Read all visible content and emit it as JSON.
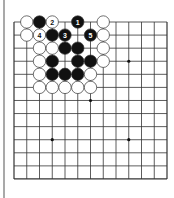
{
  "board": {
    "size_visible": {
      "cols": 13,
      "rows": 13
    },
    "origin": {
      "x": 14,
      "y": 22
    },
    "pitch": {
      "x": 12.75,
      "y": 13.08
    },
    "line_color": "#333333",
    "star_points": [
      [
        3,
        3
      ],
      [
        9,
        3
      ],
      [
        6,
        6
      ],
      [
        3,
        9
      ],
      [
        9,
        9
      ]
    ],
    "stones": [
      {
        "c": 1,
        "r": 0,
        "color": "white",
        "label": ""
      },
      {
        "c": 2,
        "r": 0,
        "color": "black",
        "label": ""
      },
      {
        "c": 3,
        "r": 0,
        "color": "white",
        "label": "2"
      },
      {
        "c": 5,
        "r": 0,
        "color": "black",
        "label": "1"
      },
      {
        "c": 7,
        "r": 0,
        "color": "white",
        "label": ""
      },
      {
        "c": 1,
        "r": 1,
        "color": "white",
        "label": ""
      },
      {
        "c": 2,
        "r": 1,
        "color": "white",
        "label": "4"
      },
      {
        "c": 3,
        "r": 1,
        "color": "black",
        "label": ""
      },
      {
        "c": 4,
        "r": 1,
        "color": "black",
        "label": "3"
      },
      {
        "c": 6,
        "r": 1,
        "color": "black",
        "label": "5"
      },
      {
        "c": 7,
        "r": 1,
        "color": "white",
        "label": ""
      },
      {
        "c": 2,
        "r": 2,
        "color": "white",
        "label": ""
      },
      {
        "c": 3,
        "r": 2,
        "color": "white",
        "label": ""
      },
      {
        "c": 4,
        "r": 2,
        "color": "black",
        "label": ""
      },
      {
        "c": 5,
        "r": 2,
        "color": "black",
        "label": ""
      },
      {
        "c": 7,
        "r": 2,
        "color": "white",
        "label": ""
      },
      {
        "c": 2,
        "r": 3,
        "color": "white",
        "label": ""
      },
      {
        "c": 3,
        "r": 3,
        "color": "black",
        "label": ""
      },
      {
        "c": 5,
        "r": 3,
        "color": "black",
        "label": ""
      },
      {
        "c": 6,
        "r": 3,
        "color": "black",
        "label": ""
      },
      {
        "c": 7,
        "r": 3,
        "color": "white",
        "label": ""
      },
      {
        "c": 2,
        "r": 4,
        "color": "white",
        "label": ""
      },
      {
        "c": 3,
        "r": 4,
        "color": "black",
        "label": ""
      },
      {
        "c": 4,
        "r": 4,
        "color": "black",
        "label": ""
      },
      {
        "c": 5,
        "r": 4,
        "color": "black",
        "label": ""
      },
      {
        "c": 6,
        "r": 4,
        "color": "white",
        "label": ""
      },
      {
        "c": 2,
        "r": 5,
        "color": "white",
        "label": ""
      },
      {
        "c": 3,
        "r": 5,
        "color": "white",
        "label": ""
      },
      {
        "c": 4,
        "r": 5,
        "color": "white",
        "label": ""
      },
      {
        "c": 5,
        "r": 5,
        "color": "white",
        "label": ""
      },
      {
        "c": 6,
        "r": 5,
        "color": "white",
        "label": ""
      }
    ]
  },
  "colors": {
    "black_stone": "#111111",
    "white_stone": "#ffffff",
    "stone_outline": "#333333",
    "left_bar": "#a9a9a9"
  }
}
